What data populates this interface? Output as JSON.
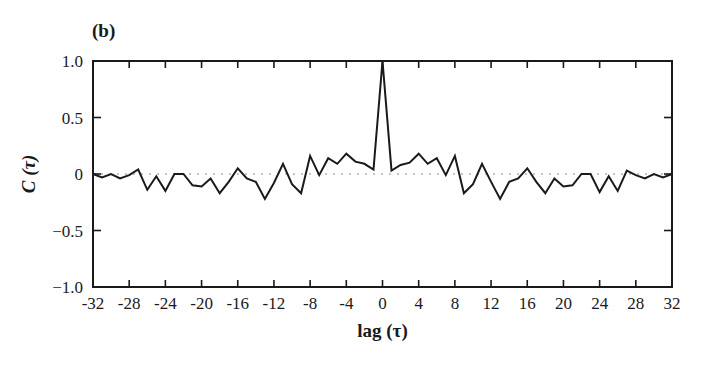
{
  "panel_label": "(b)",
  "chart_data": {
    "type": "line",
    "title": "",
    "panel_label": "(b)",
    "xlabel": "lag (τ)",
    "ylabel": "C (τ)",
    "xlim": [
      -32,
      32
    ],
    "ylim": [
      -1.0,
      1.0
    ],
    "xticks": [
      -32,
      -28,
      -24,
      -20,
      -16,
      -12,
      -8,
      -4,
      0,
      4,
      8,
      12,
      16,
      20,
      24,
      28,
      32
    ],
    "xtick_labels": [
      "-32",
      "-28",
      "-24",
      "-20",
      "-16",
      "-12",
      "-8",
      "-4",
      "0",
      "4",
      "8",
      "12",
      "16",
      "20",
      "24",
      "28",
      "32"
    ],
    "yticks": [
      1.0,
      0.5,
      0,
      -0.5,
      -1.0
    ],
    "ytick_labels": [
      "1.0",
      "0.5",
      "0",
      "-0.5",
      "-1.0"
    ],
    "grid": false,
    "legend": null,
    "reference_line": {
      "y": 0,
      "style": "dotted"
    },
    "x": [
      -32,
      -31,
      -30,
      -29,
      -28,
      -27,
      -26,
      -25,
      -24,
      -23,
      -22,
      -21,
      -20,
      -19,
      -18,
      -17,
      -16,
      -15,
      -14,
      -13,
      -12,
      -11,
      -10,
      -9,
      -8,
      -7,
      -6,
      -5,
      -4,
      -3,
      -2,
      -1,
      0,
      1,
      2,
      3,
      4,
      5,
      6,
      7,
      8,
      9,
      10,
      11,
      12,
      13,
      14,
      15,
      16,
      17,
      18,
      19,
      20,
      21,
      22,
      23,
      24,
      25,
      26,
      27,
      28,
      29,
      30,
      31,
      32
    ],
    "series": [
      {
        "name": "C(τ)",
        "values": [
          0.0,
          -0.03,
          0.0,
          -0.04,
          -0.01,
          0.04,
          -0.14,
          -0.02,
          -0.15,
          0.0,
          0.0,
          -0.1,
          -0.11,
          -0.04,
          -0.17,
          -0.07,
          0.05,
          -0.04,
          -0.07,
          -0.22,
          -0.08,
          0.09,
          -0.09,
          -0.17,
          0.16,
          -0.01,
          0.14,
          0.09,
          0.18,
          0.11,
          0.09,
          0.04,
          1.0,
          0.03,
          0.08,
          0.1,
          0.18,
          0.09,
          0.14,
          -0.01,
          0.16,
          -0.17,
          -0.09,
          0.09,
          -0.07,
          -0.22,
          -0.07,
          -0.04,
          0.05,
          -0.07,
          -0.17,
          -0.04,
          -0.11,
          -0.1,
          0.0,
          0.0,
          -0.16,
          -0.02,
          -0.15,
          0.03,
          -0.01,
          -0.04,
          0.0,
          -0.03,
          0.0
        ],
        "color": "#1a1a1a"
      }
    ]
  }
}
